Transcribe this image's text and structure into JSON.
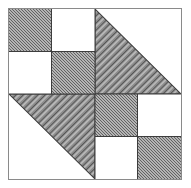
{
  "figure": {
    "title": "Quilt Block Pattern",
    "type": "geometric-quilt-block",
    "canvas_width": 191,
    "canvas_height": 188,
    "background_color": "#ffffff"
  },
  "block": {
    "frame_color": "#8a8a8a",
    "grid_line_color": "#3d3d3d",
    "fill_white": "#ffffff",
    "fill_shaded": "#8d8d8d",
    "shading_style": "diagonal-hatch-45",
    "left": 8,
    "top": 8,
    "width": 174,
    "height": 172
  },
  "quadrants": [
    {
      "id": "top-left",
      "name": "top-left-quadrant",
      "pattern": "checkerboard",
      "cells": [
        {
          "position": "top-left",
          "fill": "shaded"
        },
        {
          "position": "top-right",
          "fill": "white"
        },
        {
          "position": "bottom-left",
          "fill": "white"
        },
        {
          "position": "bottom-right",
          "fill": "shaded"
        }
      ]
    },
    {
      "id": "top-right",
      "name": "top-right-quadrant",
      "pattern": "half-square-triangle",
      "diagonal": "top-left-to-bottom-right",
      "shaded_half": "lower-left",
      "cells": [
        {
          "position": "lower-left",
          "fill": "shaded"
        },
        {
          "position": "upper-right",
          "fill": "white"
        }
      ]
    },
    {
      "id": "bottom-left",
      "name": "bottom-left-quadrant",
      "pattern": "half-square-triangle",
      "diagonal": "top-left-to-bottom-right",
      "shaded_half": "upper-right",
      "cells": [
        {
          "position": "upper-right",
          "fill": "shaded"
        },
        {
          "position": "lower-left",
          "fill": "white"
        }
      ]
    },
    {
      "id": "bottom-right",
      "name": "bottom-right-quadrant",
      "pattern": "checkerboard",
      "cells": [
        {
          "position": "top-left",
          "fill": "shaded"
        },
        {
          "position": "top-right",
          "fill": "white"
        },
        {
          "position": "bottom-left",
          "fill": "white"
        },
        {
          "position": "bottom-right",
          "fill": "shaded"
        }
      ]
    }
  ]
}
